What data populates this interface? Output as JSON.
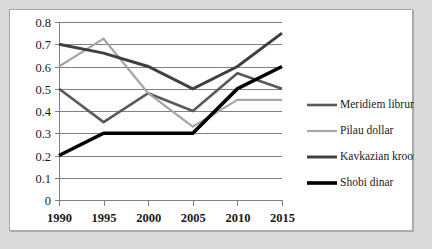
{
  "chart_data": {
    "type": "line",
    "title": "",
    "xlabel": "",
    "ylabel": "",
    "categories": [
      "1990",
      "1995",
      "2000",
      "2005",
      "2010",
      "2015"
    ],
    "ylim": [
      0,
      0.8
    ],
    "yticks": [
      "0",
      "0.1",
      "0.2",
      "0.3",
      "0.4",
      "0.5",
      "0.6",
      "0.7",
      "0.8"
    ],
    "grid": true,
    "legend_position": "right",
    "series": [
      {
        "name": "Meridiem librum",
        "color": "#595959",
        "values": [
          0.5,
          0.35,
          0.48,
          0.4,
          0.57,
          0.5
        ]
      },
      {
        "name": "Pilau dollar",
        "color": "#a6a6a6",
        "values": [
          0.6,
          0.725,
          0.48,
          0.33,
          0.45,
          0.45
        ]
      },
      {
        "name": "Kavkazian kroom",
        "color": "#404040",
        "values": [
          0.7,
          0.66,
          0.6,
          0.5,
          0.6,
          0.75
        ]
      },
      {
        "name": "Shobi dinar",
        "color": "#000000",
        "values": [
          0.2,
          0.3,
          0.3,
          0.3,
          0.5,
          0.6
        ]
      }
    ]
  },
  "legend": {
    "entries": [
      {
        "label": "Meridiem librum",
        "color": "#595959",
        "width": 2.6
      },
      {
        "label": "Pilau dollar",
        "color": "#a6a6a6",
        "width": 2.2
      },
      {
        "label": "Kavkazian kroom",
        "color": "#404040",
        "width": 3.0
      },
      {
        "label": "Shobi dinar",
        "color": "#000000",
        "width": 3.6
      }
    ]
  },
  "colors": {
    "page_background": "#d9d9d9",
    "panel_background": "#ffffff",
    "panel_border": "#a8a8a8",
    "gridline": "#808080",
    "axis": "#808080",
    "text": "#1a1a1a"
  }
}
